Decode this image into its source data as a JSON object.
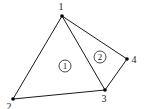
{
  "diagram": {
    "title": "",
    "nodes": [
      {
        "id": "1",
        "label": "1",
        "x": 62,
        "y": 16,
        "lx": 61,
        "ly": 10
      },
      {
        "id": "2",
        "label": "2",
        "x": 13,
        "y": 99,
        "lx": 9,
        "ly": 110
      },
      {
        "id": "3",
        "label": "3",
        "x": 105,
        "y": 90,
        "lx": 104,
        "ly": 102
      },
      {
        "id": "4",
        "label": "4",
        "x": 127,
        "y": 59,
        "lx": 134,
        "ly": 63
      }
    ],
    "edges": [
      {
        "from": "1",
        "to": "2"
      },
      {
        "from": "2",
        "to": "3"
      },
      {
        "from": "1",
        "to": "3"
      },
      {
        "from": "1",
        "to": "4"
      },
      {
        "from": "3",
        "to": "4"
      }
    ],
    "elements": [
      {
        "id": "1",
        "label": "1",
        "cx": 65,
        "cy": 66,
        "r": 6
      },
      {
        "id": "2",
        "label": "2",
        "cx": 100,
        "cy": 57,
        "r": 6
      }
    ],
    "colors": {
      "stroke": "#1a1a1a",
      "background": "#ffffff"
    }
  }
}
